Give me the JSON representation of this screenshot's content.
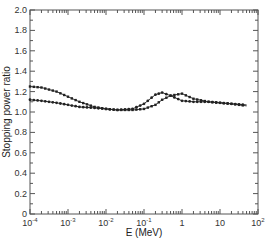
{
  "chart_data": {
    "type": "line",
    "title": "",
    "xlabel": "E (MeV)",
    "ylabel": "Stopping power ratio",
    "xscale": "log",
    "xlim": [
      0.0001,
      100
    ],
    "ylim": [
      0,
      2.0
    ],
    "grid": false,
    "legend": null,
    "x_ticks": [
      "10^-4",
      "10^-3",
      "10^-2",
      "10^-1",
      "1",
      "10",
      "10^2"
    ],
    "y_ticks": [
      "0",
      "0.2",
      "0.4",
      "0.6",
      "0.8",
      "1.0",
      "1.2",
      "1.4",
      "1.6",
      "1.8",
      "2.0"
    ],
    "series": [
      {
        "name": "series-squares",
        "marker": "square",
        "x": [
          0.0001,
          0.0002,
          0.0005,
          0.001,
          0.002,
          0.005,
          0.01,
          0.02,
          0.05,
          0.1,
          0.2,
          0.3,
          0.5,
          1,
          2,
          5,
          10,
          20,
          50
        ],
        "y": [
          1.25,
          1.24,
          1.2,
          1.15,
          1.1,
          1.05,
          1.03,
          1.02,
          1.02,
          1.03,
          1.07,
          1.12,
          1.16,
          1.18,
          1.13,
          1.1,
          1.09,
          1.08,
          1.06
        ]
      },
      {
        "name": "series-circles",
        "marker": "circle",
        "x": [
          0.0001,
          0.0002,
          0.0005,
          0.001,
          0.002,
          0.005,
          0.01,
          0.02,
          0.05,
          0.1,
          0.2,
          0.3,
          0.5,
          1,
          2,
          5,
          10,
          20,
          50
        ],
        "y": [
          1.12,
          1.11,
          1.09,
          1.07,
          1.05,
          1.04,
          1.03,
          1.02,
          1.03,
          1.08,
          1.17,
          1.19,
          1.16,
          1.11,
          1.1,
          1.1,
          1.09,
          1.08,
          1.07
        ]
      }
    ]
  }
}
